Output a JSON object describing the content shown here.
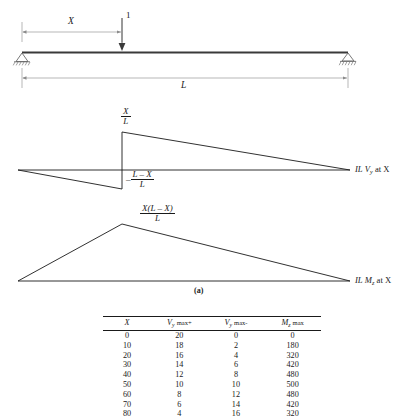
{
  "figure": {
    "caption": "(a)",
    "beam": {
      "load_label": "1",
      "dim_x_label": "X",
      "dim_l_label": "L",
      "left_support": "pin-support",
      "right_support": "roller-support"
    },
    "shear_diagram": {
      "peak_pos_num": "X",
      "peak_pos_den": "L",
      "peak_neg_sign": "–",
      "peak_neg_num": "L – X",
      "peak_neg_den": "L",
      "axis_label_prefix": "IL",
      "axis_label_symbol": "V",
      "axis_label_sub": "y",
      "axis_label_suffix": "at X"
    },
    "moment_diagram": {
      "peak_num": "X(L – X)",
      "peak_den": "L",
      "axis_label_prefix": "IL",
      "axis_label_symbol": "M",
      "axis_label_sub": "z",
      "axis_label_suffix": "at X"
    }
  },
  "table": {
    "headers": [
      {
        "main": "X",
        "sub": "",
        "suffix": ""
      },
      {
        "main": "V",
        "sub": "y",
        "suffix": "max+"
      },
      {
        "main": "V",
        "sub": "y",
        "suffix": "max-"
      },
      {
        "main": "M",
        "sub": "z",
        "suffix": "max"
      }
    ],
    "rows": [
      [
        "0",
        "20",
        "0",
        "0"
      ],
      [
        "10",
        "18",
        "2",
        "180"
      ],
      [
        "20",
        "16",
        "4",
        "320"
      ],
      [
        "30",
        "14",
        "6",
        "420"
      ],
      [
        "40",
        "12",
        "8",
        "480"
      ],
      [
        "50",
        "10",
        "10",
        "500"
      ],
      [
        "60",
        "8",
        "12",
        "480"
      ],
      [
        "70",
        "6",
        "14",
        "420"
      ],
      [
        "80",
        "4",
        "16",
        "320"
      ]
    ]
  },
  "chart_data": {
    "type": "line",
    "xlabel": "X",
    "ylabel": "Influence ordinate",
    "series": [
      {
        "name": "IL Vy at X",
        "x": [
          0,
          122,
          122,
          348
        ],
        "values": [
          0,
          0.37,
          -0.63,
          0
        ]
      },
      {
        "name": "IL Mz at X",
        "x": [
          0,
          122,
          348
        ],
        "values": [
          0,
          0.26,
          0
        ]
      }
    ],
    "table": {
      "columns": [
        "X",
        "Vy max+",
        "Vy max-",
        "Mz max"
      ],
      "rows": [
        [
          0,
          20,
          0,
          0
        ],
        [
          10,
          18,
          2,
          180
        ],
        [
          20,
          16,
          4,
          320
        ],
        [
          30,
          14,
          6,
          420
        ],
        [
          40,
          12,
          8,
          480
        ],
        [
          50,
          10,
          10,
          500
        ],
        [
          60,
          8,
          12,
          480
        ],
        [
          70,
          6,
          14,
          420
        ],
        [
          80,
          4,
          16,
          320
        ]
      ]
    }
  }
}
